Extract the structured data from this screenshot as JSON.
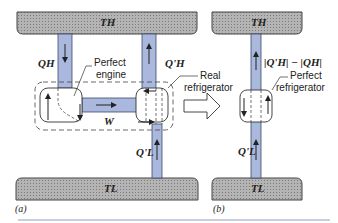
{
  "figure": {
    "panel_a": {
      "caption": "(a)",
      "hot_reservoir": "TH",
      "cold_reservoir": "TL",
      "q_h": "QH",
      "q_h_prime": "Q'H",
      "q_l_prime": "Q'L",
      "work": "W",
      "engine_label": "Perfect engine",
      "engine_label_line1": "Perfect",
      "engine_label_line2": "engine",
      "refrigerator_label_line1": "Real",
      "refrigerator_label_line2": "refrigerator"
    },
    "panel_b": {
      "caption": "(b)",
      "hot_reservoir": "TH",
      "cold_reservoir": "TL",
      "net_heat": "|Q'H| − |QH|",
      "q_l_prime": "Q'L",
      "refrigerator_label_line1": "Perfect",
      "refrigerator_label_line2": "refrigerator"
    },
    "colors": {
      "pipe": "#a9b8dc",
      "pipe_edge": "#3c4a6a",
      "reservoir": "#a8a8a8",
      "rule": "#8fa0c8"
    }
  }
}
